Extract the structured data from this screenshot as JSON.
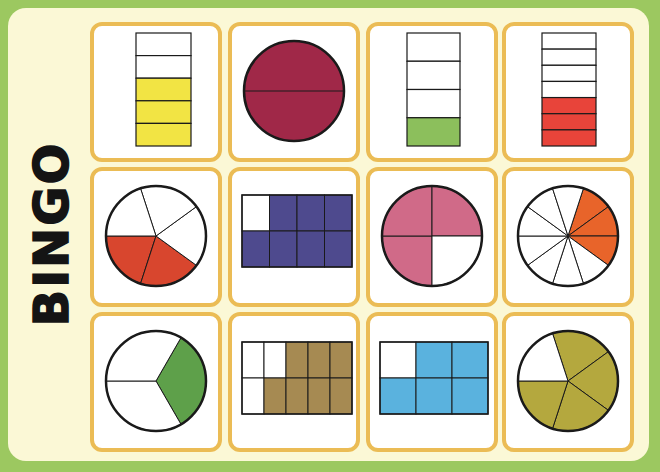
{
  "title": "BINGO",
  "colors": {
    "background_green": "#9cc860",
    "panel_cream": "#fbf8d6",
    "card_border": "#ebbc55",
    "outline": "#1a1a1a"
  },
  "cards": [
    {
      "row": 1,
      "col": 1,
      "shape": "vertical-bar",
      "parts": 5,
      "shaded": 3,
      "fraction": "3/5",
      "color": "#f2e444"
    },
    {
      "row": 1,
      "col": 2,
      "shape": "circle",
      "parts": 2,
      "shaded": 2,
      "fraction": "2/2",
      "color": "#a02848"
    },
    {
      "row": 1,
      "col": 3,
      "shape": "vertical-bar",
      "parts": 4,
      "shaded": 1,
      "fraction": "1/4",
      "color": "#8cbf5c"
    },
    {
      "row": 1,
      "col": 4,
      "shape": "vertical-bar",
      "parts": 7,
      "shaded": 3,
      "fraction": "3/7",
      "color": "#e8443a"
    },
    {
      "row": 2,
      "col": 1,
      "shape": "circle",
      "parts": 5,
      "shaded": 2,
      "fraction": "2/5",
      "color": "#d8462e"
    },
    {
      "row": 2,
      "col": 2,
      "shape": "grid",
      "rows": 2,
      "cols": 4,
      "parts": 8,
      "shaded": 7,
      "fraction": "7/8",
      "color": "#4e4a8e"
    },
    {
      "row": 2,
      "col": 3,
      "shape": "circle",
      "parts": 4,
      "shaded": 3,
      "fraction": "3/4",
      "color": "#d06a88"
    },
    {
      "row": 2,
      "col": 4,
      "shape": "circle",
      "parts": 10,
      "shaded": 3,
      "fraction": "3/10",
      "color": "#e8642a"
    },
    {
      "row": 3,
      "col": 1,
      "shape": "circle",
      "parts": 3,
      "shaded": 1,
      "fraction": "1/3",
      "color": "#5ea04a"
    },
    {
      "row": 3,
      "col": 2,
      "shape": "grid",
      "rows": 2,
      "cols": 5,
      "parts": 10,
      "shaded": 7,
      "fraction": "7/10",
      "color": "#a68a52"
    },
    {
      "row": 3,
      "col": 3,
      "shape": "grid",
      "rows": 2,
      "cols": 3,
      "parts": 6,
      "shaded": 5,
      "fraction": "5/6",
      "color": "#5ab2de"
    },
    {
      "row": 3,
      "col": 4,
      "shape": "circle",
      "parts": 5,
      "shaded": 4,
      "fraction": "4/5",
      "color": "#b4a83e"
    }
  ]
}
